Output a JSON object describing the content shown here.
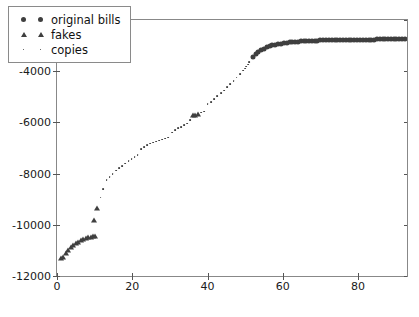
{
  "chart_data": {
    "type": "scatter",
    "title": "",
    "xlabel": "",
    "ylabel": "",
    "xlim": [
      0,
      93
    ],
    "ylim": [
      -12000,
      -2000
    ],
    "grid": false,
    "legend_position": "upper left",
    "xticks": [
      0,
      20,
      40,
      60,
      80
    ],
    "yticks": [
      -12000,
      -10000,
      -8000,
      -6000,
      -4000,
      -2000
    ],
    "xticklabels": [
      "0",
      "20",
      "40",
      "60",
      "80"
    ],
    "yticklabels": [
      "-12000",
      "-10000",
      "-8000",
      "-6000",
      "-4000",
      "-2000"
    ],
    "marker_color": "#3f3f3f",
    "series": [
      {
        "name": "original bills",
        "marker": "circle",
        "points": [
          [
            52.0,
            -3430
          ],
          [
            52.8,
            -3330
          ],
          [
            53.5,
            -3250
          ],
          [
            54.2,
            -3180
          ],
          [
            55.0,
            -3120
          ],
          [
            55.8,
            -3070
          ],
          [
            56.5,
            -3030
          ],
          [
            57.2,
            -2995
          ],
          [
            58.0,
            -2965
          ],
          [
            58.8,
            -2940
          ],
          [
            59.5,
            -2920
          ],
          [
            60.2,
            -2903
          ],
          [
            61.0,
            -2888
          ],
          [
            61.8,
            -2875
          ],
          [
            62.5,
            -2864
          ],
          [
            63.2,
            -2854
          ],
          [
            64.0,
            -2845
          ],
          [
            64.8,
            -2837
          ],
          [
            65.5,
            -2830
          ],
          [
            66.2,
            -2824
          ],
          [
            67.0,
            -2818
          ],
          [
            67.8,
            -2813
          ],
          [
            68.5,
            -2808
          ],
          [
            69.2,
            -2804
          ],
          [
            70.0,
            -2800
          ],
          [
            70.8,
            -2796
          ],
          [
            71.5,
            -2793
          ],
          [
            72.2,
            -2790
          ],
          [
            73.0,
            -2787
          ],
          [
            73.8,
            -2784
          ],
          [
            74.5,
            -2782
          ],
          [
            75.2,
            -2780
          ],
          [
            76.0,
            -2778
          ],
          [
            76.8,
            -2776
          ],
          [
            77.5,
            -2774
          ],
          [
            78.2,
            -2772
          ],
          [
            79.0,
            -2771
          ],
          [
            79.8,
            -2769
          ],
          [
            80.5,
            -2768
          ],
          [
            81.2,
            -2766
          ],
          [
            82.0,
            -2765
          ],
          [
            82.8,
            -2764
          ],
          [
            83.5,
            -2763
          ],
          [
            84.2,
            -2762
          ],
          [
            85.0,
            -2761
          ],
          [
            85.8,
            -2760
          ],
          [
            86.5,
            -2759
          ],
          [
            87.2,
            -2758
          ],
          [
            88.0,
            -2757
          ],
          [
            88.8,
            -2756
          ],
          [
            89.5,
            -2755
          ],
          [
            90.2,
            -2754
          ],
          [
            91.0,
            -2753
          ],
          [
            91.8,
            -2752
          ],
          [
            92.5,
            -2751
          ]
        ]
      },
      {
        "name": "fakes",
        "marker": "triangle",
        "points": [
          [
            1.0,
            -11300
          ],
          [
            1.7,
            -11250
          ],
          [
            2.3,
            -11120
          ],
          [
            3.0,
            -11000
          ],
          [
            3.7,
            -10880
          ],
          [
            4.3,
            -10800
          ],
          [
            5.0,
            -10720
          ],
          [
            5.7,
            -10660
          ],
          [
            6.3,
            -10600
          ],
          [
            7.0,
            -10560
          ],
          [
            7.7,
            -10520
          ],
          [
            8.3,
            -10490
          ],
          [
            9.0,
            -10465
          ],
          [
            9.6,
            -10445
          ],
          [
            10.2,
            -10430
          ],
          [
            9.9,
            -9800
          ],
          [
            10.6,
            -9360
          ],
          [
            36.2,
            -5730
          ],
          [
            36.8,
            -5700
          ],
          [
            37.4,
            -5670
          ]
        ]
      },
      {
        "name": "copies",
        "marker": "dot",
        "points": [
          [
            11.6,
            -8940
          ],
          [
            12.3,
            -8600
          ],
          [
            13.2,
            -8260
          ],
          [
            14.0,
            -8130
          ],
          [
            14.8,
            -8010
          ],
          [
            15.7,
            -7880
          ],
          [
            16.5,
            -7790
          ],
          [
            17.3,
            -7700
          ],
          [
            18.2,
            -7610
          ],
          [
            19.0,
            -7520
          ],
          [
            19.8,
            -7440
          ],
          [
            20.6,
            -7370
          ],
          [
            21.4,
            -7290
          ],
          [
            22.3,
            -7040
          ],
          [
            23.1,
            -6980
          ],
          [
            24.0,
            -6900
          ],
          [
            24.8,
            -6830
          ],
          [
            25.6,
            -6790
          ],
          [
            26.4,
            -6750
          ],
          [
            27.2,
            -6710
          ],
          [
            28.0,
            -6670
          ],
          [
            28.8,
            -6630
          ],
          [
            29.6,
            -6590
          ],
          [
            30.5,
            -6400
          ],
          [
            31.3,
            -6300
          ],
          [
            32.1,
            -6220
          ],
          [
            32.9,
            -6170
          ],
          [
            33.7,
            -6110
          ],
          [
            34.5,
            -6050
          ],
          [
            35.3,
            -5920
          ],
          [
            38.2,
            -5620
          ],
          [
            39.0,
            -5580
          ],
          [
            40.0,
            -5300
          ],
          [
            40.9,
            -5200
          ],
          [
            41.8,
            -5080
          ],
          [
            42.6,
            -4980
          ],
          [
            43.5,
            -4870
          ],
          [
            44.3,
            -4760
          ],
          [
            45.2,
            -4620
          ],
          [
            46.0,
            -4500
          ],
          [
            46.9,
            -4380
          ],
          [
            47.7,
            -4250
          ],
          [
            48.6,
            -4110
          ],
          [
            49.4,
            -3980
          ],
          [
            50.2,
            -3820
          ],
          [
            51.0,
            -3650
          ],
          [
            49.9,
            -3900
          ],
          [
            50.7,
            -3740
          ]
        ]
      }
    ]
  },
  "legend": {
    "entries": [
      {
        "label": "original bills",
        "marker": "circle"
      },
      {
        "label": "fakes",
        "marker": "triangle"
      },
      {
        "label": "copies",
        "marker": "dot"
      }
    ]
  }
}
